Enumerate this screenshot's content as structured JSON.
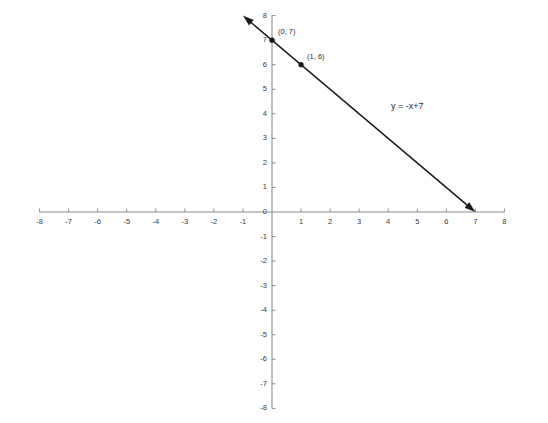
{
  "chart_data": {
    "type": "line",
    "title": "",
    "subtitle": "",
    "xlabel": "",
    "ylabel": "",
    "xlim": [
      -8,
      8
    ],
    "ylim": [
      -8,
      8
    ],
    "grid": false,
    "legend": null,
    "equation": "y = -x+7",
    "series": [
      {
        "name": "y = -x+7",
        "slope": -1,
        "intercept": 7,
        "x": [
          -1,
          7
        ],
        "values": [
          8,
          0
        ],
        "arrow_start": true,
        "arrow_end": true,
        "color": "#1a1a1a"
      }
    ],
    "annotations": [
      {
        "text": "(0, 7)",
        "x": 0,
        "y": 7,
        "marker": true
      },
      {
        "text": "(1, 6)",
        "x": 1,
        "y": 6,
        "marker": true
      },
      {
        "text": "y = -x+7",
        "x": 4.1,
        "y": 4.5,
        "marker": false
      }
    ],
    "xticks": [
      {
        "value": -8,
        "label": "-8"
      },
      {
        "value": -7,
        "label": "-7"
      },
      {
        "value": -6,
        "label": "-6"
      },
      {
        "value": -5,
        "label": "-5"
      },
      {
        "value": -4,
        "label": "-4"
      },
      {
        "value": -3,
        "label": "-3"
      },
      {
        "value": -2,
        "label": "-2"
      },
      {
        "value": -1,
        "label": "-1"
      },
      {
        "value": 1,
        "label": "1"
      },
      {
        "value": 2,
        "label": "2"
      },
      {
        "value": 3,
        "label": "3"
      },
      {
        "value": 4,
        "label": "4"
      },
      {
        "value": 5,
        "label": "5"
      },
      {
        "value": 6,
        "label": "6"
      },
      {
        "value": 7,
        "label": "7"
      },
      {
        "value": 8,
        "label": "8"
      }
    ],
    "yticks": [
      {
        "value": 8,
        "label": "8"
      },
      {
        "value": 7,
        "label": "7"
      },
      {
        "value": 6,
        "label": "6"
      },
      {
        "value": 5,
        "label": "5"
      },
      {
        "value": 4,
        "label": "4"
      },
      {
        "value": 3,
        "label": "3"
      },
      {
        "value": 2,
        "label": "2"
      },
      {
        "value": 1,
        "label": "1"
      },
      {
        "value": -1,
        "label": "-1"
      },
      {
        "value": -2,
        "label": "-2"
      },
      {
        "value": -3,
        "label": "-3"
      },
      {
        "value": -4,
        "label": "-4"
      },
      {
        "value": -5,
        "label": "-5"
      },
      {
        "value": -6,
        "label": "-6"
      },
      {
        "value": -7,
        "label": "-7"
      },
      {
        "value": -8,
        "label": "-8"
      }
    ],
    "origin_label": "0",
    "colors": {
      "axis": "#8c8c8c",
      "line": "#1a1a1a",
      "tick_text": "#3a3a3a",
      "background": "#ffffff"
    }
  }
}
